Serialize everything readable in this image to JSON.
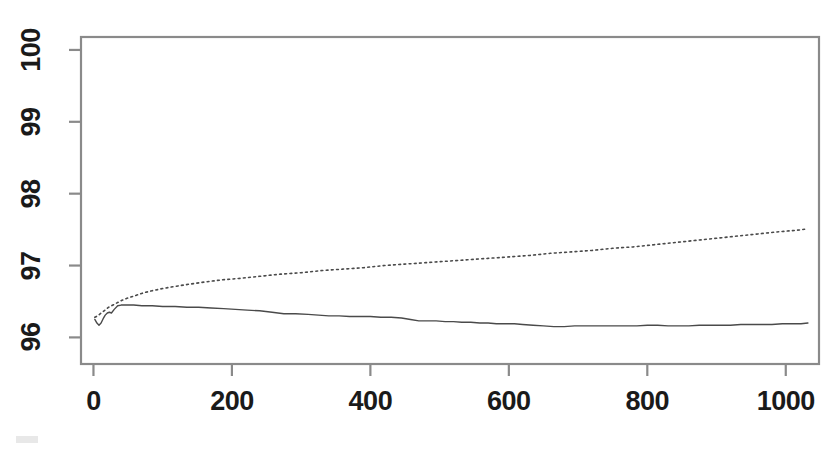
{
  "figure": {
    "background_color": "#ffffff",
    "axis_color": "#8a8a8a",
    "label_color": "#1a1a1a",
    "plot_frame": {
      "left": 81,
      "top": 37,
      "right": 819,
      "bottom": 364
    }
  },
  "chart_data": {
    "type": "line",
    "title": "",
    "subtitle": "",
    "xlabel": "",
    "ylabel": "",
    "xlim": [
      -18,
      1048
    ],
    "ylim": [
      95.63,
      100.18
    ],
    "grid": false,
    "legend": null,
    "annotations": [],
    "x_ticks": [
      0,
      200,
      400,
      600,
      800,
      1000
    ],
    "x_tick_labels": [
      "0",
      "200",
      "400",
      "600",
      "800",
      "1000"
    ],
    "y_ticks": [
      96,
      97,
      98,
      99,
      100
    ],
    "y_tick_labels": [
      "96",
      "97",
      "98",
      "99",
      "100"
    ],
    "series": [
      {
        "name": "dotted-upper-curve",
        "style": "dotted",
        "color": "#4a4a4a",
        "width": 1.6,
        "x": [
          2,
          6,
          10,
          14,
          18,
          22,
          26,
          30,
          36,
          42,
          50,
          60,
          72,
          85,
          100,
          118,
          138,
          160,
          185,
          210,
          240,
          270,
          300,
          330,
          360,
          390,
          420,
          450,
          480,
          510,
          540,
          570,
          600,
          630,
          660,
          690,
          720,
          750,
          780,
          810,
          840,
          870,
          900,
          930,
          960,
          990,
          1015,
          1032
        ],
        "y": [
          96.28,
          96.3,
          96.33,
          96.36,
          96.39,
          96.42,
          96.44,
          96.46,
          96.49,
          96.52,
          96.55,
          96.58,
          96.62,
          96.65,
          96.68,
          96.71,
          96.74,
          96.77,
          96.8,
          96.82,
          96.85,
          96.88,
          96.9,
          96.93,
          96.95,
          96.97,
          97.0,
          97.02,
          97.04,
          97.06,
          97.08,
          97.1,
          97.12,
          97.14,
          97.17,
          97.19,
          97.21,
          97.24,
          97.26,
          97.29,
          97.32,
          97.35,
          97.38,
          97.41,
          97.44,
          97.47,
          97.49,
          97.51
        ]
      },
      {
        "name": "solid-lower-curve",
        "style": "solid",
        "color": "#4a4a4a",
        "width": 1.4,
        "x": [
          2,
          5,
          8,
          11,
          14,
          17,
          20,
          23,
          26,
          30,
          35,
          40,
          48,
          58,
          70,
          85,
          100,
          118,
          135,
          152,
          170,
          188,
          205,
          222,
          240,
          258,
          275,
          292,
          310,
          325,
          340,
          355,
          370,
          385,
          400,
          415,
          430,
          445,
          458,
          470,
          482,
          495,
          508,
          520,
          532,
          545,
          558,
          570,
          582,
          595,
          608,
          620,
          635,
          650,
          665,
          680,
          695,
          710,
          725,
          740,
          755,
          770,
          785,
          800,
          815,
          830,
          845,
          860,
          875,
          890,
          905,
          920,
          935,
          950,
          965,
          980,
          995,
          1010,
          1022,
          1032
        ],
        "y": [
          96.25,
          96.2,
          96.17,
          96.2,
          96.26,
          96.31,
          96.34,
          96.35,
          96.34,
          96.39,
          96.44,
          96.45,
          96.45,
          96.45,
          96.44,
          96.44,
          96.43,
          96.43,
          96.42,
          96.42,
          96.41,
          96.4,
          96.39,
          96.38,
          96.37,
          96.35,
          96.33,
          96.33,
          96.32,
          96.31,
          96.3,
          96.3,
          96.29,
          96.29,
          96.29,
          96.28,
          96.28,
          96.27,
          96.25,
          96.23,
          96.23,
          96.23,
          96.22,
          96.22,
          96.21,
          96.21,
          96.2,
          96.2,
          96.19,
          96.19,
          96.19,
          96.18,
          96.17,
          96.16,
          96.15,
          96.15,
          96.16,
          96.16,
          96.16,
          96.16,
          96.16,
          96.16,
          96.16,
          96.17,
          96.17,
          96.16,
          96.16,
          96.16,
          96.17,
          96.17,
          96.17,
          96.17,
          96.18,
          96.18,
          96.18,
          96.18,
          96.19,
          96.19,
          96.19,
          96.2
        ]
      }
    ]
  }
}
